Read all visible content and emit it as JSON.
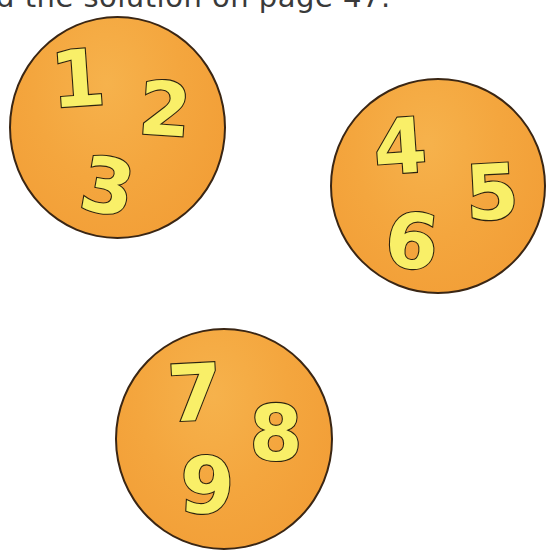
{
  "header": {
    "text": "d the solution on page 47."
  },
  "colors": {
    "circle_fill": "#f4a63e",
    "circle_outline": "#3a2614",
    "digit_fill": "#f9ef68",
    "digit_outline": "#2c2310",
    "text": "#3a3a3a"
  },
  "circles": [
    {
      "label": "circle-1",
      "digits": [
        "1",
        "2",
        "3"
      ]
    },
    {
      "label": "circle-2",
      "digits": [
        "4",
        "5",
        "6"
      ]
    },
    {
      "label": "circle-3",
      "digits": [
        "7",
        "8",
        "9"
      ]
    }
  ]
}
